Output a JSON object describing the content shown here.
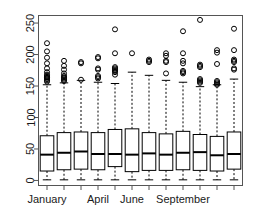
{
  "chart_data": {
    "type": "box",
    "title": "",
    "xlabel": "",
    "ylabel": "",
    "ylim": [
      -8,
      262
    ],
    "yticks": [
      0,
      50,
      100,
      150,
      200,
      250
    ],
    "ytick_labels": [
      "0",
      "50",
      "100",
      "150",
      "200",
      "250"
    ],
    "grid": false,
    "legend": null,
    "x_axis_orientation": "horizontal",
    "y_axis_orientation": "rotated",
    "categories": [
      "January",
      "February",
      "March",
      "April",
      "May",
      "June",
      "July",
      "August",
      "September",
      "October",
      "November",
      "December"
    ],
    "visible_xtick_labels": [
      "January",
      "April",
      "June",
      "September"
    ],
    "visible_xtick_label_indices": [
      0,
      3,
      5,
      8
    ],
    "n_boxes": 12,
    "boxes": [
      {
        "category": "January",
        "whisker_low": 1,
        "q1": 15,
        "median": 41,
        "q3": 71,
        "whisker_high": 152,
        "outliers": [
          157,
          159,
          161,
          163,
          164,
          166,
          168,
          172,
          178,
          186,
          195,
          205,
          218
        ]
      },
      {
        "category": "February",
        "whisker_low": 1,
        "q1": 17,
        "median": 44,
        "q3": 76,
        "whisker_high": 155,
        "outliers": [
          158,
          160,
          162,
          164,
          166,
          170,
          176,
          182,
          190
        ]
      },
      {
        "category": "March",
        "whisker_low": 1,
        "q1": 18,
        "median": 46,
        "q3": 77,
        "whisker_high": 159,
        "outliers": [
          160,
          186,
          188
        ]
      },
      {
        "category": "April",
        "whisker_low": 1,
        "q1": 17,
        "median": 42,
        "q3": 76,
        "whisker_high": 156,
        "outliers": [
          162,
          164,
          166,
          176,
          178,
          194,
          196
        ]
      },
      {
        "category": "May",
        "whisker_low": 1,
        "q1": 22,
        "median": 42,
        "q3": 81,
        "whisker_high": 154,
        "outliers": [
          168,
          172,
          174,
          176,
          178,
          180,
          202,
          240
        ]
      },
      {
        "category": "June",
        "whisker_low": 1,
        "q1": 14,
        "median": 41,
        "q3": 82,
        "whisker_high": 172,
        "outliers": [
          202
        ]
      },
      {
        "category": "July",
        "whisker_low": 1,
        "q1": 16,
        "median": 43,
        "q3": 76,
        "whisker_high": 167,
        "outliers": [
          188,
          190,
          192
        ]
      },
      {
        "category": "August",
        "whisker_low": 1,
        "q1": 16,
        "median": 41,
        "q3": 74,
        "whisker_high": 159,
        "outliers": [
          170,
          188,
          190,
          198,
          202
        ]
      },
      {
        "category": "September",
        "whisker_low": 1,
        "q1": 17,
        "median": 44,
        "q3": 78,
        "whisker_high": 156,
        "outliers": [
          170,
          172,
          174,
          186,
          190,
          202,
          237
        ]
      },
      {
        "category": "October",
        "whisker_low": 1,
        "q1": 16,
        "median": 45,
        "q3": 73,
        "whisker_high": 149,
        "outliers": [
          155,
          157,
          159,
          161,
          180,
          182,
          184,
          255
        ]
      },
      {
        "category": "November",
        "whisker_low": 1,
        "q1": 15,
        "median": 40,
        "q3": 70,
        "whisker_high": 152,
        "outliers": [
          152,
          154,
          156,
          158,
          185,
          203,
          207
        ]
      },
      {
        "category": "December",
        "whisker_low": 1,
        "q1": 18,
        "median": 42,
        "q3": 77,
        "whisker_high": 161,
        "outliers": [
          176,
          178,
          188,
          190,
          192,
          207,
          241
        ]
      }
    ]
  },
  "style": {
    "line_color": "#000000",
    "box_fill": "#ffffff",
    "axis_color": "#555555",
    "background": "#ffffff",
    "median_width": 2,
    "outlier_radius": 2.5
  }
}
